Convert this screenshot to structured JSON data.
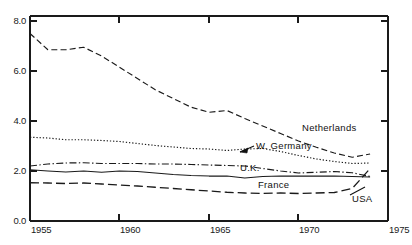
{
  "chart_data": {
    "type": "line",
    "title": "",
    "subtitle": "",
    "xlabel": "",
    "ylabel": "",
    "xlim": [
      1955,
      1975
    ],
    "ylim": [
      0.0,
      8.0
    ],
    "xticks": [
      1955,
      1960,
      1965,
      1970,
      1975
    ],
    "xtick_labels": [
      "1955",
      "1960",
      "1965",
      "1970",
      "1975"
    ],
    "yticks": [
      0.0,
      2.0,
      4.0,
      6.0,
      8.0
    ],
    "ytick_labels": [
      "0.0",
      "2.0",
      "4.0",
      "6.0",
      "8.0"
    ],
    "grid": false,
    "legend_position": "inline-annotations",
    "x": [
      1955,
      1956,
      1957,
      1958,
      1959,
      1960,
      1961,
      1962,
      1963,
      1964,
      1965,
      1966,
      1967,
      1968,
      1969,
      1970,
      1971,
      1972,
      1973,
      1974
    ],
    "series": [
      {
        "name": "Netherlands",
        "line_style": "dashed",
        "color": "#1a1a1a",
        "values": [
          7.5,
          6.85,
          6.85,
          6.95,
          6.6,
          6.15,
          5.7,
          5.25,
          4.9,
          4.55,
          4.35,
          4.42,
          4.1,
          3.8,
          3.5,
          3.2,
          2.95,
          2.72,
          2.55,
          2.68
        ]
      },
      {
        "name": "W. Germany",
        "line_style": "dotted",
        "color": "#1a1a1a",
        "values": [
          3.35,
          3.32,
          3.25,
          3.25,
          3.22,
          3.18,
          3.1,
          3.02,
          2.96,
          2.9,
          2.88,
          2.82,
          2.88,
          2.9,
          2.78,
          2.62,
          2.48,
          2.38,
          2.3,
          2.32
        ]
      },
      {
        "name": "U.K.",
        "line_style": "dash-dot",
        "color": "#1a1a1a",
        "values": [
          2.2,
          2.28,
          2.32,
          2.33,
          2.3,
          2.3,
          2.3,
          2.28,
          2.28,
          2.26,
          2.24,
          2.22,
          2.2,
          2.1,
          2.0,
          1.92,
          1.95,
          1.98,
          1.93,
          1.78
        ]
      },
      {
        "name": "France",
        "line_style": "solid",
        "color": "#1a1a1a",
        "values": [
          2.05,
          2.0,
          1.96,
          2.0,
          1.95,
          2.0,
          1.98,
          1.92,
          1.86,
          1.82,
          1.8,
          1.8,
          1.72,
          1.78,
          1.8,
          1.8,
          1.8,
          1.8,
          1.78,
          1.76
        ]
      },
      {
        "name": "USA",
        "line_style": "long-dash",
        "color": "#1a1a1a",
        "values": [
          1.53,
          1.52,
          1.5,
          1.52,
          1.48,
          1.44,
          1.4,
          1.35,
          1.3,
          1.25,
          1.2,
          1.15,
          1.12,
          1.1,
          1.12,
          1.1,
          1.12,
          1.14,
          1.3,
          2.1
        ]
      }
    ],
    "annotations": [
      {
        "text": "Netherlands",
        "x": 302,
        "y": 131
      },
      {
        "text": "W. Germany",
        "x": 256,
        "y": 149,
        "has_arrow": true
      },
      {
        "text": "U.K.",
        "x": 240,
        "y": 171
      },
      {
        "text": "France",
        "x": 258,
        "y": 188
      },
      {
        "text": "USA",
        "x": 352,
        "y": 202
      }
    ]
  }
}
